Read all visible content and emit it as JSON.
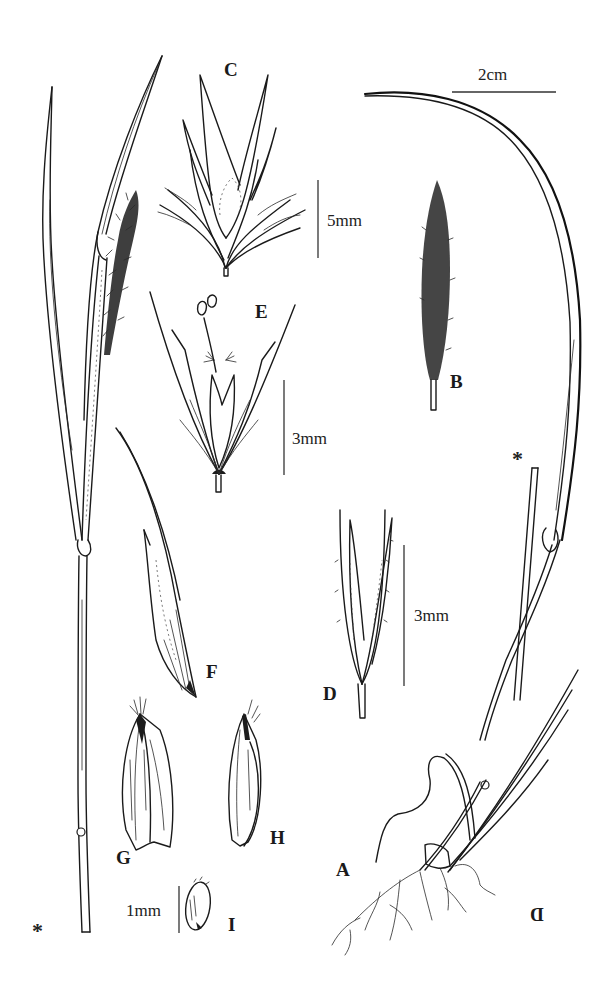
{
  "figure": {
    "type": "botanical-illustration-plate",
    "panels": [
      {
        "id": "A",
        "label": "A",
        "description": "habit: whole plant with roots, culms and leaves"
      },
      {
        "id": "B",
        "label": "B",
        "description": "panicle (spike-like inflorescence)"
      },
      {
        "id": "C",
        "label": "C",
        "description": "cluster of spikelets"
      },
      {
        "id": "D",
        "label": "D",
        "description": "spikelet"
      },
      {
        "id": "E",
        "label": "E",
        "description": "floret with stamens and stigmas"
      },
      {
        "id": "F",
        "label": "F",
        "description": "glume"
      },
      {
        "id": "G",
        "label": "G",
        "description": "lemma"
      },
      {
        "id": "H",
        "label": "H",
        "description": "palea"
      },
      {
        "id": "I",
        "label": "I",
        "description": "caryopsis"
      }
    ],
    "scale_bars": [
      {
        "id": "scale-2cm",
        "text": "2cm",
        "applies_to": "A, B"
      },
      {
        "id": "scale-5mm",
        "text": "5mm",
        "applies_to": "C"
      },
      {
        "id": "scale-3mm-e",
        "text": "3mm",
        "applies_to": "E"
      },
      {
        "id": "scale-3mm-d",
        "text": "3mm",
        "applies_to": "D"
      },
      {
        "id": "scale-1mm",
        "text": "1mm",
        "applies_to": "F, G, H, I"
      }
    ],
    "markers": {
      "asterisk": "*",
      "mirrored_d": "D"
    },
    "colors": {
      "background": "#ffffff",
      "ink": "#1a1a1a"
    }
  }
}
